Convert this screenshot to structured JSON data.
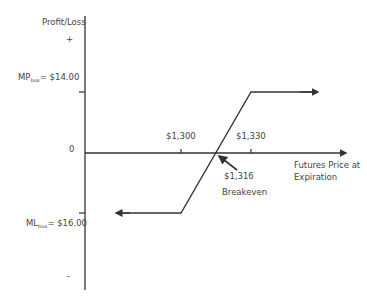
{
  "diagram": {
    "y_axis_label": "Profit/Loss",
    "plus_marker": "+",
    "minus_marker": "-",
    "zero_label": "0",
    "max_profit": {
      "prefix": "MP",
      "subscript": "bux",
      "value": "= $14.00"
    },
    "max_loss": {
      "prefix": "ML",
      "subscript": "bux",
      "value": "= $16.00"
    },
    "x_axis_label_line1": "Futures Price at",
    "x_axis_label_line2": "Expiration",
    "ticks": [
      {
        "label": "$1,300"
      },
      {
        "label": "$1,330"
      }
    ],
    "breakeven_value": "$1,316",
    "breakeven_label": "Breakeven",
    "line_color": "#333333"
  }
}
